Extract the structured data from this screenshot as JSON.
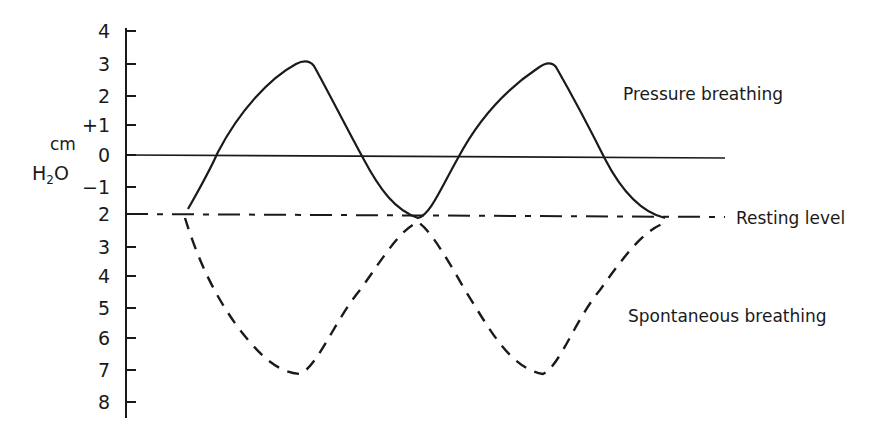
{
  "chart_data": {
    "type": "line",
    "title": "",
    "ylabel": "cm H2O",
    "ylabel_line1": "cm",
    "ylabel_line2_main": "H",
    "ylabel_line2_sub": "2",
    "ylabel_line2_end": "O",
    "y_ticks": [
      "4",
      "3",
      "2",
      "+1",
      "0",
      "−1",
      "2",
      "3",
      "4",
      "5",
      "6",
      "7",
      "8"
    ],
    "y_tick_values": [
      4,
      3,
      2,
      1,
      0,
      -1,
      -2,
      -3,
      -4,
      -5,
      -6,
      -7,
      -8
    ],
    "ylim": [
      -8,
      4
    ],
    "reference_lines": [
      {
        "name": "zero-line",
        "y": 0,
        "style": "solid"
      },
      {
        "name": "resting-level",
        "y": -2,
        "style": "dash-dot",
        "label": "Resting level"
      }
    ],
    "series": [
      {
        "name": "Pressure breathing",
        "style": "solid",
        "x_relative": [
          0,
          0.5,
          1,
          1.5,
          2
        ],
        "values": [
          -2,
          3,
          -2,
          3,
          -2
        ]
      },
      {
        "name": "Spontaneous breathing",
        "style": "dashed",
        "x_relative": [
          0,
          0.5,
          1,
          1.5,
          2
        ],
        "values": [
          -2,
          -7,
          -2,
          -7,
          -2
        ]
      }
    ],
    "annotations": [
      "Pressure breathing",
      "Resting level",
      "Spontaneous breathing"
    ],
    "grid": false,
    "legend": "none (inline labels)"
  },
  "labels": {
    "pressure": "Pressure breathing",
    "resting": "Resting level",
    "spontaneous": "Spontaneous breathing"
  }
}
